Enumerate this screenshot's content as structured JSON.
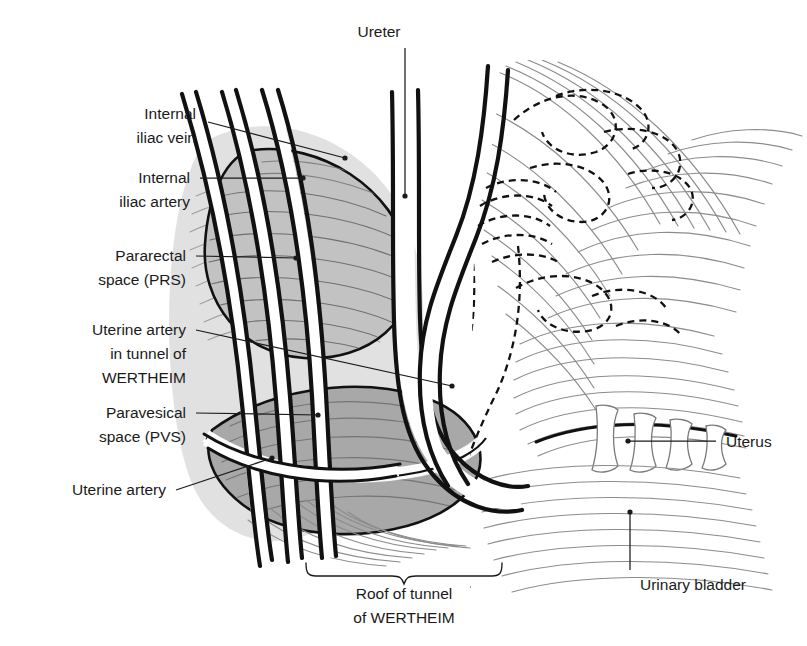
{
  "figure": {
    "background_color": "#ffffff",
    "ink_color": "#1a1a1a",
    "space_fill_light": "#c9c9c9",
    "space_fill_dark": "#a3a3a3",
    "striation_color": "#8c8c8c"
  },
  "labels": {
    "ureter": "Ureter",
    "internal_iliac_vein_line1": "Internal",
    "internal_iliac_vein_line2": "iliac vein",
    "internal_iliac_artery_line1": "Internal",
    "internal_iliac_artery_line2": "iliac artery",
    "pararectal_line1": "Pararectal",
    "pararectal_line2": "space (PRS)",
    "uterine_artery_tunnel_line1": "Uterine artery",
    "uterine_artery_tunnel_line2": "in tunnel of",
    "uterine_artery_tunnel_line3": "WERTHEIM",
    "paravesical_line1": "Paravesical",
    "paravesical_line2": "space (PVS)",
    "uterine_artery": "Uterine artery",
    "roof_line1": "Roof of tunnel",
    "roof_line2": "of WERTHEIM",
    "uterus": "Uterus",
    "urinary_bladder": "Urinary bladder"
  }
}
